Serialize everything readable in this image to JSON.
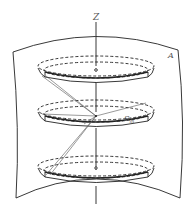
{
  "diagram": {
    "axis_label": "Z",
    "surface_label": "A",
    "point_label_main": "S",
    "point_label_sub": "m",
    "disk_count": 3,
    "colors": {
      "line": "#222222",
      "ray": "#555555",
      "label": "#555555",
      "background": "#ffffff"
    }
  }
}
